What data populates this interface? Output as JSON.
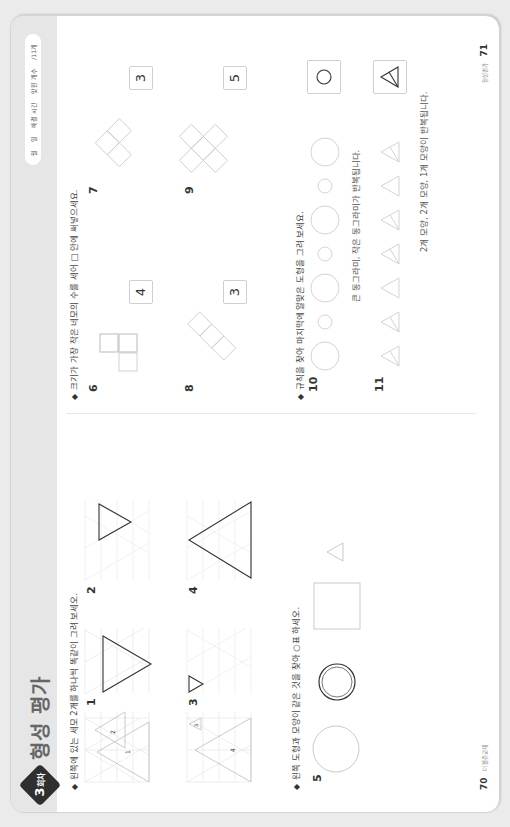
{
  "header": {
    "badge_number": "3",
    "badge_suffix": "회차",
    "title": "형성 평가",
    "record": {
      "month": "월",
      "day": "일",
      "time_label": "해결 시간",
      "score_label": "맞힌 개수",
      "total": "/11개"
    }
  },
  "left_page": {
    "page_number": "70",
    "footer_text": "더 볼쥬교재",
    "section1": {
      "instruction": "왼쪽에 있는 세모 2개를 하나씩 똑같이 그려 보세오.",
      "questions": [
        {
          "num": "1",
          "labels": [
            "1",
            "2"
          ]
        },
        {
          "num": "2"
        },
        {
          "num": "3",
          "labels": [
            "3",
            "4"
          ]
        },
        {
          "num": "4"
        }
      ]
    },
    "section2": {
      "instruction": "왼쪽 도형과 모양이 같은 것을 찾아 ○표 하세오.",
      "question": {
        "num": "5",
        "options": [
          "circle-selected",
          "square",
          "triangle"
        ]
      }
    }
  },
  "right_page": {
    "page_number": "71",
    "footer_text": "형성평가",
    "section3": {
      "instruction": "크기가 가장 작은 네모의 수를 세어 □ 안에 써넣으세요.",
      "questions": [
        {
          "num": "6",
          "answer": "4"
        },
        {
          "num": "7",
          "answer": "3"
        },
        {
          "num": "8",
          "answer": "3"
        },
        {
          "num": "9",
          "answer": "5"
        }
      ]
    },
    "section4": {
      "instruction": "규칙을 찾아 마지막에 알맞은 도형을 그려 보세요.",
      "questions": [
        {
          "num": "10",
          "rule": "큰 동그라미, 작은 동그라미가 반복됩니다.",
          "answer": "circle"
        },
        {
          "num": "11",
          "rule": "2개 모양, 2개 모양, 1개 모양이 반복됩니다.",
          "answer": "split-triangle"
        }
      ]
    }
  },
  "colors": {
    "header_band": "#e6e6e6",
    "badge": "#2f2f2f",
    "grid": "#e3e3e3",
    "shape_light": "#bdbdbd",
    "shape_dark": "#333333"
  }
}
